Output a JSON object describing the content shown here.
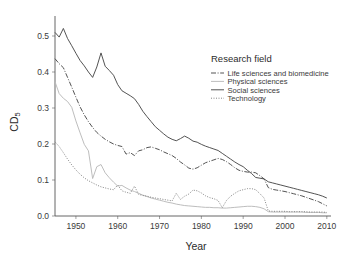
{
  "chart_data": {
    "type": "line",
    "title": "",
    "xlabel": "Year",
    "ylabel": "CD5",
    "ylabel_display": "CD",
    "ylabel_sub": "5",
    "xlim": [
      1945,
      2011
    ],
    "ylim": [
      0.0,
      0.55
    ],
    "grid": false,
    "legend_position": "right-top",
    "legend_title": "Research field",
    "xticks": [
      1950,
      1960,
      1970,
      1980,
      1990,
      2000,
      2010
    ],
    "xtick_labels": [
      "1950",
      "1960",
      "1970",
      "1980",
      "1990",
      "2000",
      "2010"
    ],
    "yticks": [
      0.0,
      0.1,
      0.2,
      0.3,
      0.4,
      0.5
    ],
    "ytick_labels": [
      "0.0",
      "0.1",
      "0.2",
      "0.3",
      "0.4",
      "0.5"
    ],
    "x": [
      1945,
      1946,
      1947,
      1948,
      1949,
      1950,
      1951,
      1952,
      1953,
      1954,
      1955,
      1956,
      1957,
      1958,
      1959,
      1960,
      1961,
      1962,
      1963,
      1964,
      1965,
      1966,
      1967,
      1968,
      1969,
      1970,
      1971,
      1972,
      1973,
      1974,
      1975,
      1976,
      1977,
      1978,
      1979,
      1980,
      1981,
      1982,
      1983,
      1984,
      1985,
      1986,
      1987,
      1988,
      1989,
      1990,
      1991,
      1992,
      1993,
      1994,
      1995,
      1996,
      1997,
      1998,
      1999,
      2000,
      2001,
      2002,
      2003,
      2004,
      2005,
      2006,
      2007,
      2008,
      2009,
      2010
    ],
    "series": [
      {
        "name": "Life sciences and biomedicine",
        "style": "dashdot",
        "color": "#4a4a4a",
        "values": [
          0.437,
          0.423,
          0.412,
          0.385,
          0.358,
          0.33,
          0.303,
          0.281,
          0.262,
          0.246,
          0.232,
          0.222,
          0.213,
          0.206,
          0.2,
          0.196,
          0.193,
          0.172,
          0.176,
          0.168,
          0.181,
          0.184,
          0.19,
          0.192,
          0.188,
          0.184,
          0.178,
          0.173,
          0.168,
          0.16,
          0.15,
          0.142,
          0.133,
          0.13,
          0.134,
          0.141,
          0.148,
          0.152,
          0.156,
          0.16,
          0.157,
          0.151,
          0.143,
          0.134,
          0.127,
          0.124,
          0.122,
          0.122,
          0.12,
          0.112,
          0.103,
          0.079,
          0.074,
          0.072,
          0.07,
          0.068,
          0.065,
          0.062,
          0.059,
          0.056,
          0.052,
          0.048,
          0.044,
          0.04,
          0.034,
          0.028
        ]
      },
      {
        "name": "Physical sciences",
        "style": "solid-light",
        "color": "#b9b9b9",
        "values": [
          0.373,
          0.34,
          0.327,
          0.318,
          0.302,
          0.264,
          0.231,
          0.199,
          0.181,
          0.104,
          0.137,
          0.143,
          0.12,
          0.106,
          0.094,
          0.083,
          0.085,
          0.078,
          0.072,
          0.068,
          0.063,
          0.058,
          0.054,
          0.05,
          0.047,
          0.044,
          0.041,
          0.038,
          0.036,
          0.033,
          0.031,
          0.029,
          0.028,
          0.027,
          0.026,
          0.025,
          0.024,
          0.024,
          0.023,
          0.023,
          0.022,
          0.022,
          0.023,
          0.024,
          0.025,
          0.026,
          0.027,
          0.027,
          0.026,
          0.024,
          0.02,
          0.012,
          0.011,
          0.011,
          0.011,
          0.011,
          0.011,
          0.011,
          0.011,
          0.011,
          0.01,
          0.01,
          0.01,
          0.01,
          0.009,
          0.009
        ]
      },
      {
        "name": "Social sciences",
        "style": "solid",
        "color": "#4a4a4a",
        "values": [
          0.51,
          0.497,
          0.521,
          0.493,
          0.473,
          0.452,
          0.432,
          0.417,
          0.4,
          0.385,
          0.414,
          0.453,
          0.416,
          0.404,
          0.391,
          0.365,
          0.348,
          0.341,
          0.334,
          0.326,
          0.31,
          0.291,
          0.276,
          0.262,
          0.248,
          0.238,
          0.228,
          0.219,
          0.213,
          0.209,
          0.215,
          0.222,
          0.216,
          0.208,
          0.205,
          0.199,
          0.194,
          0.19,
          0.186,
          0.182,
          0.174,
          0.166,
          0.158,
          0.15,
          0.143,
          0.137,
          0.127,
          0.118,
          0.107,
          0.105,
          0.103,
          0.095,
          0.092,
          0.089,
          0.086,
          0.083,
          0.08,
          0.077,
          0.074,
          0.071,
          0.068,
          0.065,
          0.062,
          0.059,
          0.055,
          0.05
        ]
      },
      {
        "name": "Technology",
        "style": "dotted",
        "color": "#7d7d7d",
        "values": [
          0.206,
          0.193,
          0.176,
          0.158,
          0.142,
          0.128,
          0.116,
          0.106,
          0.098,
          0.092,
          0.086,
          0.081,
          0.078,
          0.075,
          0.073,
          0.086,
          0.07,
          0.066,
          0.063,
          0.083,
          0.06,
          0.057,
          0.055,
          0.052,
          0.05,
          0.048,
          0.046,
          0.044,
          0.042,
          0.063,
          0.046,
          0.055,
          0.061,
          0.072,
          0.07,
          0.064,
          0.056,
          0.051,
          0.048,
          0.043,
          0.023,
          0.043,
          0.055,
          0.063,
          0.07,
          0.073,
          0.076,
          0.076,
          0.073,
          0.062,
          0.05,
          0.014,
          0.013,
          0.013,
          0.013,
          0.013,
          0.012,
          0.012,
          0.012,
          0.012,
          0.012,
          0.011,
          0.011,
          0.011,
          0.011,
          0.01
        ]
      }
    ]
  },
  "legend": {
    "title": "Research field",
    "items": [
      {
        "label": "Life sciences and biomedicine",
        "style": "dashdot"
      },
      {
        "label": "Physical sciences",
        "style": "solid-light"
      },
      {
        "label": "Social sciences",
        "style": "solid"
      },
      {
        "label": "Technology",
        "style": "dotted"
      }
    ]
  }
}
